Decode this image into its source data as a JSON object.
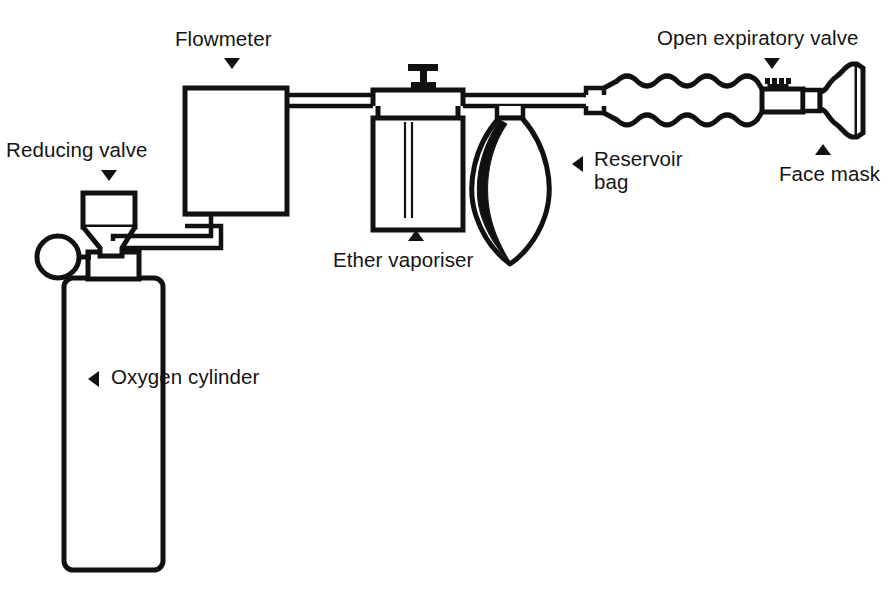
{
  "diagram": {
    "ink_color": "#111111",
    "background_color": "#ffffff",
    "labels": [
      {
        "id": "flowmeter",
        "text": "Flowmeter",
        "marker": "down"
      },
      {
        "id": "open-exp-valve",
        "text": "Open expiratory valve",
        "marker": "down"
      },
      {
        "id": "reducing-valve",
        "text": "Reducing valve",
        "marker": "down"
      },
      {
        "id": "face-mask",
        "text": "Face mask",
        "marker": "up"
      },
      {
        "id": "ether-vaporiser",
        "text": "Ether vaporiser",
        "marker": "up"
      },
      {
        "id": "reservoir-bag-1",
        "text": "Reservoir",
        "marker": "left"
      },
      {
        "id": "reservoir-bag-2",
        "text": "bag",
        "marker": "none"
      },
      {
        "id": "oxygen-cylinder",
        "text": "Oxygen cylinder",
        "marker": "left"
      }
    ],
    "components": [
      {
        "id": "oxygen-cylinder",
        "name": "Oxygen cylinder"
      },
      {
        "id": "pressure-gauge",
        "name": "Pressure gauge"
      },
      {
        "id": "reducing-valve",
        "name": "Reducing valve"
      },
      {
        "id": "supply-pipe",
        "name": "Supply pipe"
      },
      {
        "id": "flowmeter",
        "name": "Flowmeter"
      },
      {
        "id": "ether-vaporiser",
        "name": "Ether vaporiser"
      },
      {
        "id": "vaporiser-knob",
        "name": "Vaporiser control knob"
      },
      {
        "id": "reservoir-bag",
        "name": "Reservoir bag"
      },
      {
        "id": "corrugated-tube",
        "name": "Corrugated breathing tube"
      },
      {
        "id": "expiratory-valve",
        "name": "Open expiratory valve"
      },
      {
        "id": "face-mask",
        "name": "Face mask"
      }
    ]
  }
}
